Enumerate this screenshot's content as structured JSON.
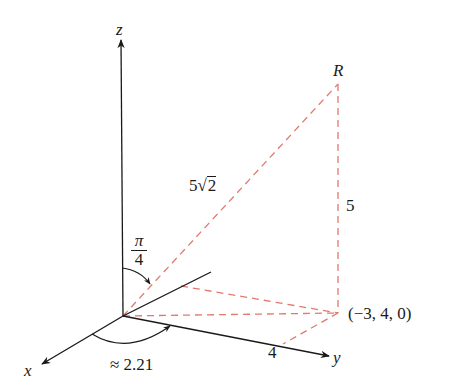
{
  "diagram": {
    "type": "3d-coordinate-system",
    "colors": {
      "axis": "#1a1a1a",
      "dashed": "#e07a6e",
      "text": "#1a1a1a",
      "background": "#ffffff"
    },
    "axes": {
      "x_label": "x",
      "y_label": "y",
      "z_label": "z"
    },
    "points": {
      "R_label": "R",
      "projection_label": "(−3, 4, 0)"
    },
    "labels": {
      "hypotenuse_prefix": "5",
      "hypotenuse_radicand": "2",
      "vertical_length": "5",
      "y_tick": "4",
      "phi_numerator": "π",
      "phi_denominator": "4",
      "theta_approx": "≈ 2.21"
    }
  }
}
